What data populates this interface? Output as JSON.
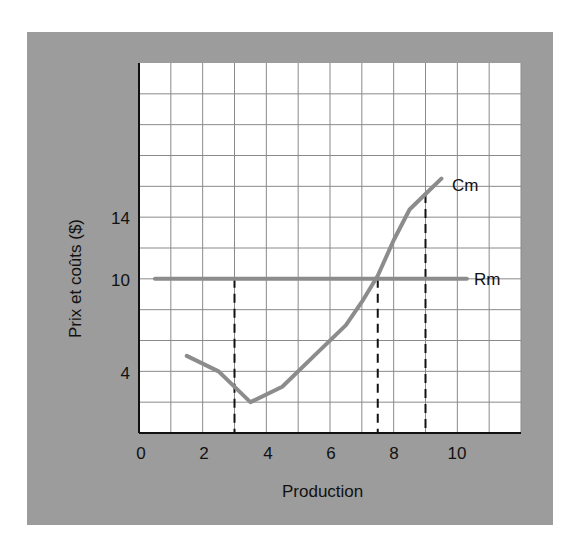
{
  "chart_data": {
    "type": "line",
    "title": "",
    "xlabel": "Production",
    "ylabel": "Prix et coûts ($)",
    "xlim": [
      0,
      12
    ],
    "ylim": [
      0,
      24
    ],
    "grid": true,
    "x_ticks": [
      "0",
      "2",
      "4",
      "6",
      "8",
      "10"
    ],
    "y_ticks": [
      "4",
      "10",
      "14"
    ],
    "series": [
      {
        "name": "Cm",
        "color": "#8c8c8c",
        "x": [
          1.5,
          2.5,
          3.5,
          4.5,
          5.5,
          6.5,
          7.0,
          7.5,
          8.0,
          8.5,
          9.0,
          9.5
        ],
        "y": [
          5.0,
          4.0,
          2.0,
          3.0,
          5.0,
          7.0,
          8.5,
          10.2,
          12.5,
          14.5,
          15.5,
          16.5
        ]
      },
      {
        "name": "Rm",
        "color": "#8c8c8c",
        "x": [
          0.5,
          10.3
        ],
        "y": [
          10,
          10
        ]
      }
    ],
    "annotations": [
      {
        "type": "dashed-vline",
        "x": 3,
        "from": 0,
        "to": 10
      },
      {
        "type": "dashed-vline",
        "x": 7.5,
        "from": 0,
        "to": 10
      },
      {
        "type": "dashed-vline",
        "x": 9,
        "from": 0,
        "to": 15.5
      },
      {
        "type": "label",
        "text": "Cm",
        "near": [
          9.5,
          16.5
        ]
      },
      {
        "type": "label",
        "text": "Rm",
        "near": [
          10.3,
          10
        ]
      }
    ]
  },
  "labels": {
    "xlabel": "Production",
    "ylabel": "Prix et coûts ($)",
    "cm": "Cm",
    "rm": "Rm",
    "xticks": [
      "0",
      "2",
      "4",
      "6",
      "8",
      "10"
    ],
    "yticks": [
      "4",
      "10",
      "14"
    ]
  }
}
